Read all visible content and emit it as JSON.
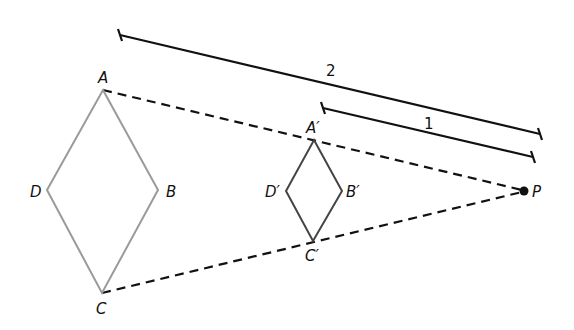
{
  "diagram": {
    "type": "dilation",
    "center": {
      "label": "P",
      "x": 524,
      "y": 191
    },
    "original": {
      "name": "rhombus ABCD",
      "color": "#9a9a9a",
      "vertices": [
        {
          "label": "A",
          "x": 103,
          "y": 90
        },
        {
          "label": "B",
          "x": 158,
          "y": 190
        },
        {
          "label": "C",
          "x": 102,
          "y": 293
        },
        {
          "label": "D",
          "x": 47,
          "y": 190
        }
      ]
    },
    "image": {
      "name": "rhombus A'B'C'D'",
      "color": "#444444",
      "vertices": [
        {
          "label": "A′",
          "x": 314,
          "y": 140
        },
        {
          "label": "B′",
          "x": 342,
          "y": 191
        },
        {
          "label": "C′",
          "x": 313,
          "y": 241
        },
        {
          "label": "D′",
          "x": 286,
          "y": 191
        }
      ]
    },
    "measures": [
      {
        "label": "2",
        "from": "P",
        "to": "A",
        "x1": 120,
        "y1": 35,
        "x2": 540,
        "y2": 134
      },
      {
        "label": "1",
        "from": "P",
        "to": "A′",
        "x1": 323,
        "y1": 108,
        "x2": 533,
        "y2": 157
      }
    ],
    "scale_factor_label": "1/2"
  }
}
